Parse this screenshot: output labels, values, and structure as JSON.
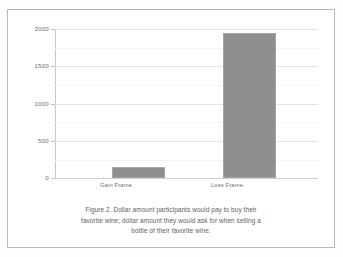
{
  "figure": {
    "caption_lines": [
      "Figure 2. Dollar amount participants would pay to buy their",
      "favorite wine; dollar amount they would ask for when selling a",
      "bottle of their favorite wine."
    ],
    "caption_full": "Figure 2. Dollar amount participants would pay to buy their favorite wine; dollar amount they would ask for when selling a bottle of their favorite wine.",
    "bar_color": "#8e8e8e",
    "bar_edge_color": "#a7a7a7",
    "gridline_color": "#e4e4e4",
    "axis_color": "#c8c8c8",
    "background_color": "#ffffff",
    "border_color": "#b9b9b9",
    "text_color": "#6f6f6f"
  },
  "chart_data": {
    "type": "bar",
    "title": "",
    "xlabel": "",
    "ylabel": "",
    "categories": [
      "Gain Frame",
      "Loss Frame"
    ],
    "values": [
      145,
      1950
    ],
    "ylim": [
      0,
      2000
    ],
    "yticks": [
      0,
      500,
      1000,
      1500,
      2000
    ],
    "ytick_labels": [
      "0",
      "500",
      "1000",
      "1500",
      "2000"
    ],
    "minor_yticks": [
      250,
      750,
      1250,
      1750
    ],
    "grid": true,
    "legend": false,
    "legend_position": "none"
  }
}
